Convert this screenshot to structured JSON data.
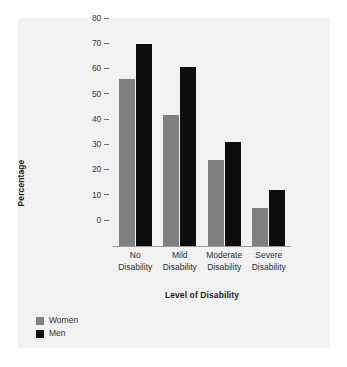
{
  "chart_data": {
    "type": "bar",
    "title": "",
    "subtitle": "",
    "xlabel": "Level of Disability",
    "ylabel": "Percentage",
    "categories": [
      "No Disability",
      "Mild Disability",
      "Moderate Disability",
      "Severe Disability"
    ],
    "category_lines": [
      [
        "No",
        "Disability"
      ],
      [
        "Mild",
        "Disability"
      ],
      [
        "Moderate",
        "Disability"
      ],
      [
        "Severe",
        "Disability"
      ]
    ],
    "series": [
      {
        "name": "Women",
        "color": "#808080",
        "values": [
          66,
          52,
          34,
          15
        ]
      },
      {
        "name": "Men",
        "color": "#0d0d0d",
        "values": [
          80,
          71,
          41,
          22
        ]
      }
    ],
    "ylim": [
      0,
      80
    ],
    "yticks": [
      80,
      70,
      60,
      50,
      40,
      30,
      20,
      10,
      0
    ],
    "ytick_labels": [
      "80",
      "70",
      "60",
      "50",
      "40",
      "30",
      "20",
      "10",
      "0"
    ],
    "grid": false,
    "legend_position": "bottom-left",
    "legend": [
      "Women",
      "Men"
    ],
    "background_color": "#f2f2f2",
    "page_color": "#ffffff",
    "axis_color": "#6d6d6d"
  }
}
